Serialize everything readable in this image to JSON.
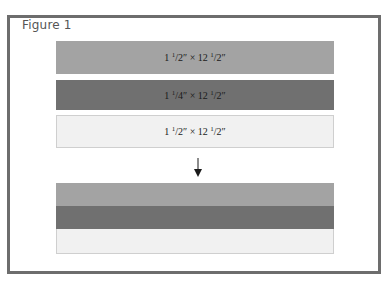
{
  "figure": {
    "title": "Figure 1"
  },
  "strips": [
    {
      "label": "1 ½″ × 12 ½″",
      "whole": "1",
      "frac_num": "1",
      "frac_den": "2",
      "by": "×",
      "length_whole": "12",
      "length_num": "1",
      "length_den": "2",
      "color": "#a3a3a3"
    },
    {
      "label": "1 ¼″ × 12 ½″",
      "whole": "1",
      "frac_num": "1",
      "frac_den": "4",
      "by": "×",
      "length_whole": "12",
      "length_num": "1",
      "length_den": "2",
      "color": "#707070"
    },
    {
      "label": "1 ½″ × 12 ½″",
      "whole": "1",
      "frac_num": "1",
      "frac_den": "2",
      "by": "×",
      "length_whole": "12",
      "length_num": "1",
      "length_den": "2",
      "color": "#f1f1f1"
    }
  ],
  "arrow": {
    "icon": "arrow-down-icon"
  },
  "result": {
    "bands": [
      {
        "color": "#a3a3a3"
      },
      {
        "color": "#707070"
      },
      {
        "color": "#f1f1f1"
      }
    ]
  },
  "colors": {
    "frame": "#6d6d6d",
    "light_border": "#cfcfcf"
  }
}
